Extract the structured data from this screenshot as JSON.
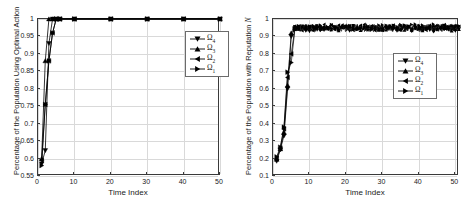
{
  "figure": {
    "background": "#ffffff",
    "line_color": "#000000",
    "grid_color": "#d9d9d9",
    "axis_color": "#3a3a3a"
  },
  "panels": [
    {
      "id": "left-panel",
      "ylabel": "Percentage of the Population Using Optimal Action",
      "xlabel": "Time Index",
      "xticks": [
        "0",
        "10",
        "20",
        "30",
        "40",
        "50"
      ],
      "yticks": [
        "0.55",
        "0.6",
        "0.65",
        "0.7",
        "0.75",
        "0.8",
        "0.85",
        "0.9",
        "0.95",
        "1"
      ],
      "legend": [
        {
          "label": "Ω",
          "sub": "4",
          "marker": "triangle-down"
        },
        {
          "label": "Ω",
          "sub": "3",
          "marker": "triangle-up"
        },
        {
          "label": "Ω",
          "sub": "2",
          "marker": "triangle-left"
        },
        {
          "label": "Ω",
          "sub": "1",
          "marker": "triangle-right"
        }
      ]
    },
    {
      "id": "right-panel",
      "ylabel": "Percentage of the Population with Reputation N",
      "ylabel_plain": "Percentage of the Population with Reputation ",
      "ylabel_italic": "N",
      "xlabel": "Time Index",
      "xticks": [
        "0",
        "10",
        "20",
        "30",
        "40",
        "50"
      ],
      "yticks": [
        "0.1",
        "0.2",
        "0.3",
        "0.4",
        "0.5",
        "0.6",
        "0.7",
        "0.8",
        "0.9",
        "1"
      ],
      "legend": [
        {
          "label": "Ω",
          "sub": "4",
          "marker": "triangle-down"
        },
        {
          "label": "Ω",
          "sub": "3",
          "marker": "triangle-up"
        },
        {
          "label": "Ω",
          "sub": "2",
          "marker": "triangle-left"
        },
        {
          "label": "Ω",
          "sub": "1",
          "marker": "triangle-right"
        }
      ]
    }
  ],
  "chart_data": [
    {
      "type": "line",
      "title": "",
      "xlabel": "Time Index",
      "ylabel": "Percentage of the Population Using Optimal Action",
      "xlim": [
        0,
        50
      ],
      "ylim": [
        0.55,
        1.0
      ],
      "xticks": [
        0,
        10,
        20,
        30,
        40,
        50
      ],
      "yticks": [
        0.55,
        0.6,
        0.65,
        0.7,
        0.75,
        0.8,
        0.85,
        0.9,
        0.95,
        1.0
      ],
      "grid": true,
      "legend_position": "upper-right",
      "series": [
        {
          "name": "Ω_4",
          "marker": "triangle-down",
          "x": [
            1,
            2,
            3,
            4,
            5,
            6,
            10,
            20,
            30,
            40,
            50
          ],
          "y": [
            0.585,
            0.623,
            0.93,
            1.0,
            1.0,
            1.0,
            1.0,
            1.0,
            1.0,
            1.0,
            1.0
          ]
        },
        {
          "name": "Ω_3",
          "marker": "triangle-up",
          "x": [
            1,
            2,
            3,
            4,
            5,
            6,
            10,
            20,
            30,
            40,
            50
          ],
          "y": [
            0.6,
            0.88,
            1.0,
            1.0,
            1.0,
            1.0,
            1.0,
            1.0,
            1.0,
            1.0,
            1.0
          ]
        },
        {
          "name": "Ω_2",
          "marker": "triangle-left",
          "x": [
            1,
            2,
            3,
            4,
            5,
            6,
            10,
            20,
            30,
            40,
            50
          ],
          "y": [
            0.595,
            0.755,
            0.88,
            0.96,
            1.0,
            1.0,
            1.0,
            1.0,
            1.0,
            1.0,
            1.0
          ]
        },
        {
          "name": "Ω_1",
          "marker": "triangle-right",
          "x": [
            1,
            2,
            3,
            4,
            5,
            6,
            10,
            20,
            30,
            40,
            50
          ],
          "y": [
            0.58,
            0.755,
            0.88,
            0.96,
            1.0,
            1.0,
            1.0,
            1.0,
            1.0,
            1.0,
            1.0
          ]
        }
      ]
    },
    {
      "type": "line",
      "title": "",
      "xlabel": "Time Index",
      "ylabel": "Percentage of the Population with Reputation N",
      "xlim": [
        0,
        51
      ],
      "ylim": [
        0.1,
        1.0
      ],
      "xticks": [
        0,
        10,
        20,
        30,
        40,
        50
      ],
      "yticks": [
        0.1,
        0.2,
        0.3,
        0.4,
        0.5,
        0.6,
        0.7,
        0.8,
        0.9,
        1.0
      ],
      "grid": true,
      "legend_position": "middle-right",
      "noise_plateau": {
        "mean": 0.945,
        "amplitude": 0.018,
        "start_x": 6
      },
      "series": [
        {
          "name": "Ω_4",
          "marker": "triangle-down",
          "x": [
            1,
            2,
            3,
            4,
            5,
            6
          ],
          "y": [
            0.185,
            0.25,
            0.33,
            0.6,
            0.9,
            0.945
          ]
        },
        {
          "name": "Ω_3",
          "marker": "triangle-up",
          "x": [
            1,
            2,
            3,
            4,
            5,
            6
          ],
          "y": [
            0.195,
            0.255,
            0.35,
            0.62,
            0.92,
            0.95
          ]
        },
        {
          "name": "Ω_2",
          "marker": "triangle-left",
          "x": [
            1,
            2,
            3,
            4,
            5,
            6
          ],
          "y": [
            0.2,
            0.26,
            0.37,
            0.665,
            0.8,
            0.945
          ]
        },
        {
          "name": "Ω_1",
          "marker": "triangle-right",
          "x": [
            1,
            2,
            3,
            4,
            5,
            6
          ],
          "y": [
            0.21,
            0.265,
            0.38,
            0.695,
            0.75,
            0.94
          ]
        }
      ]
    }
  ]
}
